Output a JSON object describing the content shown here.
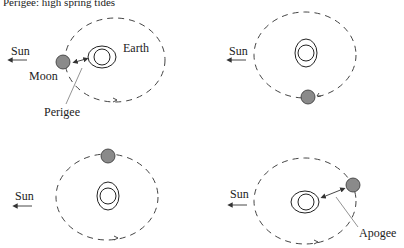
{
  "title": "Perigee: high spring tides",
  "labels": {
    "sun": "Sun",
    "moon": "Moon",
    "earth": "Earth",
    "perigee": "Perigee",
    "apogee": "Apogee"
  },
  "panels": [
    {
      "id": 1,
      "moon_position": "left (between Sun and Earth), at perigee",
      "labels": [
        "Sun",
        "Moon",
        "Earth",
        "Perigee"
      ]
    },
    {
      "id": 2,
      "moon_position": "bottom",
      "labels": [
        "Sun"
      ]
    },
    {
      "id": 3,
      "moon_position": "top",
      "labels": [
        "Sun"
      ]
    },
    {
      "id": 4,
      "moon_position": "right (far side), at apogee",
      "labels": [
        "Sun",
        "Apogee"
      ]
    }
  ],
  "colors": {
    "moon": "#8a8a8a",
    "lines": "#333333",
    "background": "#ffffff"
  }
}
